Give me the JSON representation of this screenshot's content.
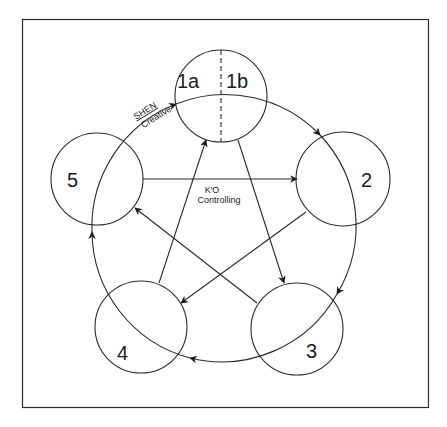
{
  "diagram": {
    "nodes": [
      {
        "id": "1",
        "label_a": "1a",
        "label_b": "1b"
      },
      {
        "id": "2",
        "label": "2"
      },
      {
        "id": "3",
        "label": "3"
      },
      {
        "id": "4",
        "label": "4"
      },
      {
        "id": "5",
        "label": "5"
      }
    ],
    "cycles": {
      "shen": {
        "name": "SHEN",
        "description": "Creative"
      },
      "ko": {
        "name": "K'O",
        "description": "Controlling"
      }
    },
    "colors": {
      "stroke": "#2a2a2a",
      "background": "#ffffff"
    }
  }
}
